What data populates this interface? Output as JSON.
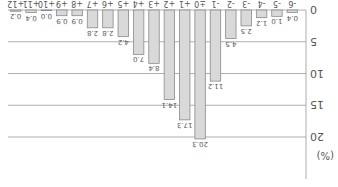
{
  "chart_data": {
    "type": "bar",
    "title": "",
    "xlabel": "",
    "ylabel": "(%)",
    "ylim": [
      0,
      25
    ],
    "yticks": [
      0,
      5,
      10,
      15,
      20
    ],
    "grid": true,
    "orientation_note": "rendered rotated 180 degrees",
    "categories": [
      "-6",
      "-5",
      "-4",
      "-3",
      "-2",
      "-1",
      "±0",
      "+1",
      "+2",
      "+3",
      "+4",
      "+5",
      "+6",
      "+7",
      "+8",
      "+9",
      "+10",
      "+11",
      "+12"
    ],
    "values": [
      0.4,
      1.0,
      1.2,
      2.5,
      4.5,
      11.2,
      20.3,
      17.3,
      14.1,
      8.4,
      7.0,
      4.2,
      2.8,
      2.8,
      0.9,
      0.9,
      0.0,
      0.4,
      0.2
    ],
    "labels": [
      "0.4",
      "1.0",
      "1.2",
      "2.5",
      "4.5",
      "11.2",
      "20.3",
      "17.3",
      "14.1",
      "8.4",
      "7.0",
      "4.2",
      "2.8",
      "2.8",
      "0.9",
      "0.9",
      "0.0",
      "0.4",
      "0.2"
    ]
  },
  "colors": {
    "bar_fill": "#d9d9d9",
    "bar_stroke": "#8a8a8a",
    "grid": "#9a9a9a",
    "text": "#555555"
  }
}
